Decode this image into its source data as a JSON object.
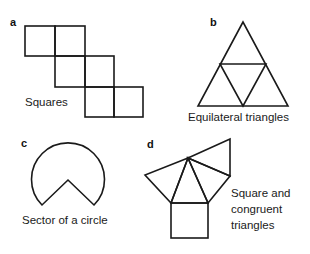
{
  "figure": {
    "panels": [
      {
        "id": "a",
        "label": "a",
        "caption": [
          "Squares"
        ]
      },
      {
        "id": "b",
        "label": "b",
        "caption": [
          "Equilateral triangles"
        ]
      },
      {
        "id": "c",
        "label": "c",
        "caption": [
          "Sector of a circle"
        ]
      },
      {
        "id": "d",
        "label": "d",
        "caption": [
          "Square and",
          "congruent",
          "triangles"
        ]
      }
    ]
  },
  "colors": {
    "stroke": "#1a1a1a",
    "background": "#ffffff"
  }
}
